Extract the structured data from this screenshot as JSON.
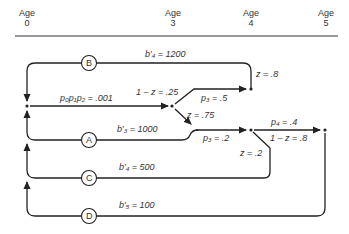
{
  "header": {
    "ages": [
      {
        "label": "Age",
        "value": "0"
      },
      {
        "label": "Age",
        "value": "3"
      },
      {
        "label": "Age",
        "value": "4"
      },
      {
        "label": "Age",
        "value": "5"
      }
    ]
  },
  "loops": {
    "B": {
      "label": "B",
      "benefit": "b′₄ = 1200"
    },
    "A": {
      "label": "A",
      "benefit": "b′₃ = 1000"
    },
    "C": {
      "label": "C",
      "benefit": "b′₄ = 500"
    },
    "D": {
      "label": "D",
      "benefit": "b′₅ = 100"
    }
  },
  "branches": {
    "p0p1p2": "p₀p₁p₂ = .001",
    "one_minus_z_25": "1 – z = .25",
    "z_75": "z = .75",
    "p3_5": "p₃ = .5",
    "z_8": "z = .8",
    "p3_2": "p₃ = .2",
    "z_2": "z = .2",
    "p4_4": "p₄ = .4",
    "one_minus_z_8": "1 – z = .8"
  }
}
